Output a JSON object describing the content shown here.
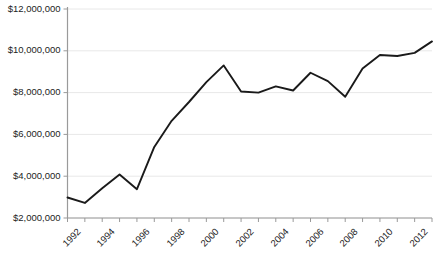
{
  "chart_data": {
    "type": "line",
    "title": "",
    "xlabel": "",
    "ylabel": "",
    "x": [
      1992,
      1993,
      1994,
      1995,
      1996,
      1997,
      1998,
      1999,
      2000,
      2001,
      2002,
      2003,
      2004,
      2005,
      2006,
      2007,
      2008,
      2009,
      2010,
      2011,
      2012,
      2013
    ],
    "values": [
      2980000,
      2720000,
      3420000,
      4080000,
      3380000,
      5400000,
      6650000,
      7550000,
      8500000,
      9300000,
      8050000,
      8000000,
      8300000,
      8100000,
      8950000,
      8550000,
      7800000,
      9150000,
      9800000,
      9750000,
      9900000,
      10450000
    ],
    "series": [
      {
        "name": "Value",
        "values": [
          2980000,
          2720000,
          3420000,
          4080000,
          3380000,
          5400000,
          6650000,
          7550000,
          8500000,
          9300000,
          8050000,
          8000000,
          8300000,
          8100000,
          8950000,
          8550000,
          7800000,
          9150000,
          9800000,
          9750000,
          9900000,
          10450000
        ]
      }
    ],
    "ylim": [
      2000000,
      12000000
    ],
    "xlim": [
      1992,
      2013
    ],
    "ytick_labels": [
      "$12,000,000",
      "$10,000,000",
      "$8,000,000",
      "$6,000,000",
      "$4,000,000",
      "$2,000,000"
    ],
    "ytick_values": [
      12000000,
      10000000,
      8000000,
      6000000,
      4000000,
      2000000
    ],
    "xtick_labels": [
      "1992",
      "1994",
      "1996",
      "1998",
      "2000",
      "2002",
      "2004",
      "2006",
      "2008",
      "2010",
      "2012"
    ],
    "xtick_values": [
      1992,
      1994,
      1996,
      1998,
      2000,
      2002,
      2004,
      2006,
      2008,
      2010,
      2012
    ],
    "grid": "horizontal",
    "legend": "none",
    "line_color": "#1a1a1a",
    "grid_color": "#e8e8e8",
    "axis_color": "#9a9a9a"
  }
}
